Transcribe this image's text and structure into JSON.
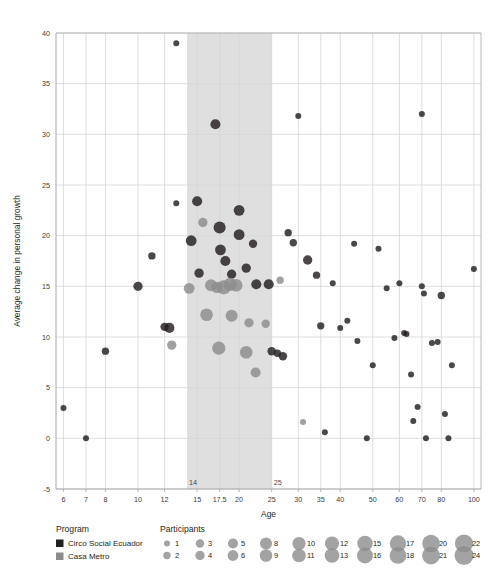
{
  "chart_data": {
    "type": "scatter",
    "title": "",
    "xlabel": "Age",
    "ylabel": "Average change in personal growth",
    "x_scale": "log",
    "xlim": [
      5.7,
      105
    ],
    "ylim": [
      -5,
      40
    ],
    "x_ticks": [
      6,
      7,
      8,
      10,
      12,
      15,
      17.5,
      20,
      25,
      30,
      35,
      40,
      50,
      60,
      70,
      80,
      100
    ],
    "x_tick_labels": [
      "6",
      "7",
      "8",
      "10",
      "12",
      "15",
      "17.5",
      "20",
      "25",
      "30",
      "35",
      "40",
      "50",
      "60",
      "70",
      "80",
      "100"
    ],
    "y_ticks": [
      -5,
      0,
      5,
      10,
      15,
      20,
      25,
      30,
      35,
      40
    ],
    "y_tick_labels": [
      "-5",
      "0",
      "5",
      "10",
      "15",
      "20",
      "25",
      "30",
      "35",
      "40"
    ],
    "grid": true,
    "legend_position": "below",
    "highlight_band": {
      "x_start": 14,
      "x_end": 25,
      "label_start": "14",
      "label_end": "25",
      "color": "#d9d9d9"
    },
    "size_legend_title": "Participants",
    "size_legend_values": [
      1,
      2,
      3,
      4,
      5,
      6,
      8,
      9,
      10,
      11,
      12,
      13,
      15,
      16,
      17,
      18,
      20,
      21,
      22,
      24
    ],
    "series": [
      {
        "name": "Circo Social Ecuador",
        "color": "#231f20",
        "points": [
          {
            "x": 6,
            "y": 3,
            "n": 1
          },
          {
            "x": 7,
            "y": 0,
            "n": 1
          },
          {
            "x": 8,
            "y": 8.6,
            "n": 2
          },
          {
            "x": 10,
            "y": 15,
            "n": 4
          },
          {
            "x": 11,
            "y": 18,
            "n": 2
          },
          {
            "x": 12,
            "y": 11,
            "n": 3
          },
          {
            "x": 12.4,
            "y": 10.9,
            "n": 5
          },
          {
            "x": 13,
            "y": 39,
            "n": 1
          },
          {
            "x": 13,
            "y": 23.2,
            "n": 1
          },
          {
            "x": 14.4,
            "y": 19.5,
            "n": 6
          },
          {
            "x": 15,
            "y": 23.4,
            "n": 5
          },
          {
            "x": 15.2,
            "y": 16.3,
            "n": 4
          },
          {
            "x": 17,
            "y": 31,
            "n": 5
          },
          {
            "x": 17.5,
            "y": 20.8,
            "n": 8
          },
          {
            "x": 17.6,
            "y": 18.6,
            "n": 6
          },
          {
            "x": 18.2,
            "y": 17.5,
            "n": 5
          },
          {
            "x": 19,
            "y": 16.2,
            "n": 4
          },
          {
            "x": 20,
            "y": 22.5,
            "n": 6
          },
          {
            "x": 20,
            "y": 20.1,
            "n": 6
          },
          {
            "x": 21,
            "y": 16.8,
            "n": 4
          },
          {
            "x": 22,
            "y": 19.2,
            "n": 3
          },
          {
            "x": 22.5,
            "y": 15.2,
            "n": 5
          },
          {
            "x": 24.5,
            "y": 15.2,
            "n": 5
          },
          {
            "x": 25,
            "y": 8.6,
            "n": 3
          },
          {
            "x": 26,
            "y": 8.4,
            "n": 2
          },
          {
            "x": 27,
            "y": 8.1,
            "n": 3
          },
          {
            "x": 28,
            "y": 20.3,
            "n": 2
          },
          {
            "x": 29,
            "y": 19.3,
            "n": 2
          },
          {
            "x": 30,
            "y": 31.8,
            "n": 1
          },
          {
            "x": 32,
            "y": 17.6,
            "n": 4
          },
          {
            "x": 34,
            "y": 16.1,
            "n": 2
          },
          {
            "x": 35,
            "y": 11.1,
            "n": 2
          },
          {
            "x": 38,
            "y": 15.3,
            "n": 1
          },
          {
            "x": 40,
            "y": 10.9,
            "n": 1
          },
          {
            "x": 42,
            "y": 11.6,
            "n": 1
          },
          {
            "x": 44,
            "y": 19.2,
            "n": 1
          },
          {
            "x": 45,
            "y": 9.6,
            "n": 1
          },
          {
            "x": 50,
            "y": 7.2,
            "n": 1
          },
          {
            "x": 52,
            "y": 18.7,
            "n": 1
          },
          {
            "x": 55,
            "y": 14.8,
            "n": 1
          },
          {
            "x": 58,
            "y": 9.9,
            "n": 1
          },
          {
            "x": 60,
            "y": 15.3,
            "n": 1
          },
          {
            "x": 62,
            "y": 10.4,
            "n": 1
          },
          {
            "x": 63,
            "y": 10.3,
            "n": 1
          },
          {
            "x": 65,
            "y": 6.3,
            "n": 1
          },
          {
            "x": 66,
            "y": 1.7,
            "n": 1
          },
          {
            "x": 68,
            "y": 3.1,
            "n": 1
          },
          {
            "x": 70,
            "y": 32,
            "n": 1
          },
          {
            "x": 70,
            "y": 15,
            "n": 1
          },
          {
            "x": 71,
            "y": 14.3,
            "n": 1
          },
          {
            "x": 72,
            "y": 0,
            "n": 1
          },
          {
            "x": 75,
            "y": 9.4,
            "n": 1
          },
          {
            "x": 78,
            "y": 9.5,
            "n": 1
          },
          {
            "x": 80,
            "y": 14.1,
            "n": 2
          },
          {
            "x": 82,
            "y": 2.4,
            "n": 1
          },
          {
            "x": 84,
            "y": 0,
            "n": 1
          },
          {
            "x": 86,
            "y": 7.2,
            "n": 1
          },
          {
            "x": 100,
            "y": 16.7,
            "n": 1
          },
          {
            "x": 36,
            "y": 0.6,
            "n": 1
          },
          {
            "x": 48,
            "y": 0,
            "n": 1
          }
        ]
      },
      {
        "name": "Casa Metro",
        "color": "#8c8c8c",
        "points": [
          {
            "x": 12.6,
            "y": 9.2,
            "n": 4
          },
          {
            "x": 14.2,
            "y": 14.8,
            "n": 6
          },
          {
            "x": 15.6,
            "y": 21.3,
            "n": 4
          },
          {
            "x": 16.5,
            "y": 15.1,
            "n": 8
          },
          {
            "x": 17.2,
            "y": 14.9,
            "n": 7
          },
          {
            "x": 18,
            "y": 14.9,
            "n": 12
          },
          {
            "x": 18.8,
            "y": 15.2,
            "n": 10
          },
          {
            "x": 19.6,
            "y": 15.1,
            "n": 9
          },
          {
            "x": 16,
            "y": 12.2,
            "n": 9
          },
          {
            "x": 19,
            "y": 12.1,
            "n": 8
          },
          {
            "x": 17.4,
            "y": 8.9,
            "n": 10
          },
          {
            "x": 21,
            "y": 8.5,
            "n": 9
          },
          {
            "x": 21.4,
            "y": 11.4,
            "n": 4
          },
          {
            "x": 22.4,
            "y": 6.5,
            "n": 5
          },
          {
            "x": 24,
            "y": 11.3,
            "n": 3
          },
          {
            "x": 26.5,
            "y": 15.6,
            "n": 2
          },
          {
            "x": 31,
            "y": 1.6,
            "n": 1
          }
        ]
      }
    ]
  },
  "legend": {
    "program_title": "Program",
    "participants_title": "Participants",
    "programs": [
      {
        "label": "Circo Social Ecuador",
        "color": "#231f20"
      },
      {
        "label": "Casa Metro",
        "color": "#8c8c8c"
      }
    ],
    "size_columns": [
      {
        "top": {
          "value": "1",
          "n": 1
        },
        "bottom": {
          "value": "2",
          "n": 2
        }
      },
      {
        "top": {
          "value": "3",
          "n": 3
        },
        "bottom": {
          "value": "4",
          "n": 4
        }
      },
      {
        "top": {
          "value": "5",
          "n": 5
        },
        "bottom": {
          "value": "6",
          "n": 6
        }
      },
      {
        "top": {
          "value": "8",
          "n": 8
        },
        "bottom": {
          "value": "9",
          "n": 9
        }
      },
      {
        "top": {
          "value": "10",
          "n": 10
        },
        "bottom": {
          "value": "11",
          "n": 11
        }
      },
      {
        "top": {
          "value": "12",
          "n": 12
        },
        "bottom": {
          "value": "13",
          "n": 13
        }
      },
      {
        "top": {
          "value": "15",
          "n": 15
        },
        "bottom": {
          "value": "16",
          "n": 16
        }
      },
      {
        "top": {
          "value": "17",
          "n": 17
        },
        "bottom": {
          "value": "18",
          "n": 18
        }
      },
      {
        "top": {
          "value": "20",
          "n": 20
        },
        "bottom": {
          "value": "21",
          "n": 21
        }
      },
      {
        "top": {
          "value": "22",
          "n": 22
        },
        "bottom": {
          "value": "24",
          "n": 24
        }
      }
    ]
  },
  "colors": {
    "grid": "#d5d5d5",
    "axis": "#a8a8a8",
    "band": "#d9d9d9",
    "dark_series": "#231f20",
    "light_series": "#8c8c8c",
    "background": "#ffffff"
  }
}
